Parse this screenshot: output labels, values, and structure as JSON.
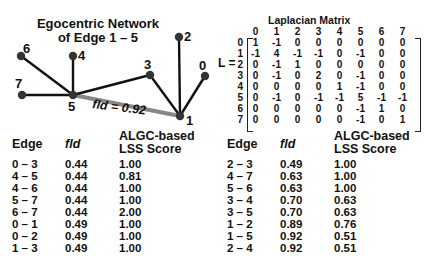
{
  "diagram": {
    "title_line1": "Egocentric Network",
    "title_line2": "of Edge 1 – 5",
    "edge_annotation": "fld = 0.92",
    "nodes": [
      {
        "id": "0",
        "x": 205,
        "y": 76
      },
      {
        "id": "1",
        "x": 180,
        "y": 116
      },
      {
        "id": "2",
        "x": 179,
        "y": 37
      },
      {
        "id": "3",
        "x": 150,
        "y": 75
      },
      {
        "id": "4",
        "x": 73,
        "y": 56
      },
      {
        "id": "5",
        "x": 73,
        "y": 95
      },
      {
        "id": "6",
        "x": 21,
        "y": 56
      },
      {
        "id": "7",
        "x": 22,
        "y": 95
      }
    ],
    "edges": [
      [
        "5",
        "6"
      ],
      [
        "5",
        "4"
      ],
      [
        "5",
        "7"
      ],
      [
        "5",
        "3"
      ],
      [
        "3",
        "1"
      ],
      [
        "2",
        "1"
      ],
      [
        "0",
        "1"
      ]
    ],
    "highlighted_edge": [
      "5",
      "1"
    ]
  },
  "matrix": {
    "title": "Laplacian Matrix",
    "label": "L =",
    "col_headers": [
      "0",
      "1",
      "2",
      "3",
      "4",
      "5",
      "6",
      "7"
    ],
    "rows": [
      {
        "h": "0",
        "v": [
          "1",
          "-1",
          "0",
          "0",
          "0",
          "0",
          "0",
          "0"
        ]
      },
      {
        "h": "1",
        "v": [
          "-1",
          "4",
          "-1",
          "-1",
          "0",
          "-1",
          "0",
          "0"
        ]
      },
      {
        "h": "2",
        "v": [
          "0",
          "-1",
          "1",
          "0",
          "0",
          "0",
          "0",
          "0"
        ]
      },
      {
        "h": "3",
        "v": [
          "0",
          "-1",
          "0",
          "2",
          "0",
          "-1",
          "0",
          "0"
        ]
      },
      {
        "h": "4",
        "v": [
          "0",
          "0",
          "0",
          "0",
          "1",
          "-1",
          "0",
          "0"
        ]
      },
      {
        "h": "5",
        "v": [
          "0",
          "-1",
          "0",
          "-1",
          "-1",
          "5",
          "-1",
          "-1"
        ]
      },
      {
        "h": "6",
        "v": [
          "0",
          "0",
          "0",
          "0",
          "0",
          "-1",
          "1",
          "0"
        ]
      },
      {
        "h": "7",
        "v": [
          "0",
          "0",
          "0",
          "0",
          "0",
          "-1",
          "0",
          "1"
        ]
      }
    ]
  },
  "tables": {
    "headers": {
      "edge": "Edge",
      "fld": "fld",
      "score_line1": "ALGC-based",
      "score_line2": "LSS Score"
    },
    "left": [
      {
        "edge": "0 – 3",
        "fld": "0.44",
        "score": "1.00"
      },
      {
        "edge": "4 – 5",
        "fld": "0.44",
        "score": "0.81"
      },
      {
        "edge": "4 – 6",
        "fld": "0.44",
        "score": "1.00"
      },
      {
        "edge": "5 – 7",
        "fld": "0.44",
        "score": "1.00"
      },
      {
        "edge": "6 – 7",
        "fld": "0.44",
        "score": "2.00"
      },
      {
        "edge": "0 – 1",
        "fld": "0.49",
        "score": "1.00"
      },
      {
        "edge": "0 – 2",
        "fld": "0.49",
        "score": "1.00"
      },
      {
        "edge": "1 – 3",
        "fld": "0.49",
        "score": "1.00"
      }
    ],
    "right": [
      {
        "edge": "2 – 3",
        "fld": "0.49",
        "score": "1.00"
      },
      {
        "edge": "4 – 7",
        "fld": "0.63",
        "score": "1.00"
      },
      {
        "edge": "5 – 6",
        "fld": "0.63",
        "score": "1.00"
      },
      {
        "edge": "3 – 4",
        "fld": "0.70",
        "score": "0.63"
      },
      {
        "edge": "3 – 5",
        "fld": "0.70",
        "score": "0.63"
      },
      {
        "edge": "1 – 2",
        "fld": "0.89",
        "score": "0.76"
      },
      {
        "edge": "1 – 5",
        "fld": "0.92",
        "score": "0.51"
      },
      {
        "edge": "2 – 4",
        "fld": "0.92",
        "score": "0.51"
      }
    ]
  }
}
